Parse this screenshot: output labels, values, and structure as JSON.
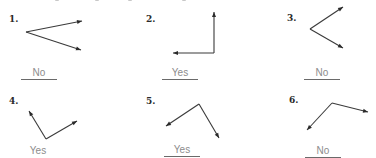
{
  "problems": [
    {
      "number": "1.",
      "answer": "No",
      "underlined": true
    },
    {
      "number": "2.",
      "answer": "Yes",
      "underlined": true
    },
    {
      "number": "3.",
      "answer": "No",
      "underlined": true
    },
    {
      "number": "4.",
      "answer": "Yes",
      "underlined": false
    },
    {
      "number": "5.",
      "answer": "Yes",
      "underlined": true
    },
    {
      "number": "6.",
      "answer": "No",
      "underlined": true
    }
  ],
  "colors": {
    "answer_text": "#8c8c8c",
    "figure_stroke": "#3a3a3a"
  }
}
